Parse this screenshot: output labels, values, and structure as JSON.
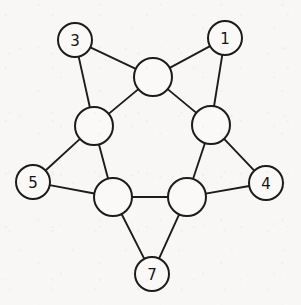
{
  "figure": {
    "domain": "Diagram",
    "type": "undirected-graph",
    "width": 301,
    "height": 305,
    "background_color": "#f8f7f5",
    "stroke_color": "#1c1c1c",
    "node_fill_color": "#faf9f7",
    "label_color": "#141414",
    "title": "",
    "caption": ""
  },
  "graph": {
    "node_count": 10,
    "edge_count": 15,
    "labeled_node_count": 5,
    "unlabeled_node_count": 5,
    "nodes": [
      {
        "id": "n-outer-3",
        "label": "3",
        "labeled": true,
        "cx": 75,
        "cy": 40,
        "r": 17,
        "position": "upper-left-outer"
      },
      {
        "id": "n-outer-1",
        "label": "1",
        "labeled": true,
        "cx": 225,
        "cy": 38,
        "r": 17,
        "position": "upper-right-outer"
      },
      {
        "id": "n-outer-5",
        "label": "5",
        "labeled": true,
        "cx": 33,
        "cy": 182,
        "r": 17,
        "position": "left-outer"
      },
      {
        "id": "n-outer-4",
        "label": "4",
        "labeled": true,
        "cx": 266,
        "cy": 183,
        "r": 17,
        "position": "right-outer"
      },
      {
        "id": "n-outer-7",
        "label": "7",
        "labeled": true,
        "cx": 152,
        "cy": 274,
        "r": 17,
        "position": "bottom-outer"
      },
      {
        "id": "n-inner-top",
        "label": "",
        "labeled": false,
        "cx": 153,
        "cy": 77,
        "r": 19,
        "position": "top-center-inner"
      },
      {
        "id": "n-inner-upper-left",
        "label": "",
        "labeled": false,
        "cx": 94,
        "cy": 126,
        "r": 19,
        "position": "upper-left-inner"
      },
      {
        "id": "n-inner-upper-right",
        "label": "",
        "labeled": false,
        "cx": 211,
        "cy": 125,
        "r": 19,
        "position": "upper-right-inner"
      },
      {
        "id": "n-inner-lower-left",
        "label": "",
        "labeled": false,
        "cx": 113,
        "cy": 197,
        "r": 19,
        "position": "lower-left-inner"
      },
      {
        "id": "n-inner-lower-right",
        "label": "",
        "labeled": false,
        "cx": 187,
        "cy": 197,
        "r": 19,
        "position": "lower-right-inner"
      }
    ],
    "edges": [
      {
        "id": "e-1",
        "from": "n-outer-3",
        "to": "n-inner-top",
        "kind": "spoke"
      },
      {
        "id": "e-2",
        "from": "n-outer-3",
        "to": "n-inner-upper-left",
        "kind": "spoke"
      },
      {
        "id": "e-3",
        "from": "n-outer-1",
        "to": "n-inner-top",
        "kind": "spoke"
      },
      {
        "id": "e-4",
        "from": "n-outer-1",
        "to": "n-inner-upper-right",
        "kind": "spoke"
      },
      {
        "id": "e-5",
        "from": "n-outer-5",
        "to": "n-inner-upper-left",
        "kind": "spoke"
      },
      {
        "id": "e-6",
        "from": "n-outer-5",
        "to": "n-inner-lower-left",
        "kind": "spoke"
      },
      {
        "id": "e-7",
        "from": "n-outer-4",
        "to": "n-inner-upper-right",
        "kind": "spoke"
      },
      {
        "id": "e-8",
        "from": "n-outer-4",
        "to": "n-inner-lower-right",
        "kind": "spoke"
      },
      {
        "id": "e-9",
        "from": "n-outer-7",
        "to": "n-inner-lower-left",
        "kind": "spoke"
      },
      {
        "id": "e-10",
        "from": "n-outer-7",
        "to": "n-inner-lower-right",
        "kind": "spoke"
      },
      {
        "id": "e-11",
        "from": "n-inner-top",
        "to": "n-inner-upper-left",
        "kind": "ring"
      },
      {
        "id": "e-12",
        "from": "n-inner-top",
        "to": "n-inner-upper-right",
        "kind": "ring"
      },
      {
        "id": "e-13",
        "from": "n-inner-upper-left",
        "to": "n-inner-lower-left",
        "kind": "ring"
      },
      {
        "id": "e-14",
        "from": "n-inner-upper-right",
        "to": "n-inner-lower-right",
        "kind": "ring"
      },
      {
        "id": "e-15",
        "from": "n-inner-lower-left",
        "to": "n-inner-lower-right",
        "kind": "ring"
      }
    ]
  }
}
